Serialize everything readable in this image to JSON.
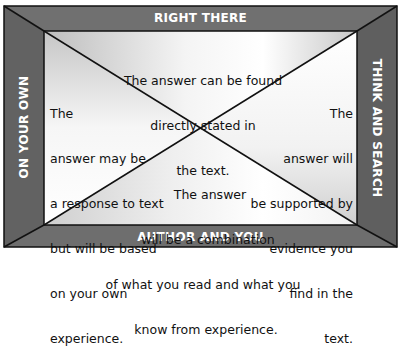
{
  "colors": {
    "frame": "#6b6b6b",
    "frame_dark": "#5a5a5a",
    "border_line": "#111111",
    "label_text": "#ffffff",
    "body_text": "#111111"
  },
  "bands": {
    "top": "RIGHT THERE",
    "bottom": "AUTHOR AND YOU",
    "left": "ON YOUR OWN",
    "right": "THINK AND SEARCH"
  },
  "quadrants": {
    "top": {
      "lines": [
        "The answer can be found",
        "directly stated in",
        "the text."
      ]
    },
    "left": {
      "lines": [
        "The",
        "answer may be",
        "a response to text",
        "but will be based",
        "on your own",
        "experience."
      ]
    },
    "right": {
      "lines": [
        "The",
        "answer will",
        "be supported by",
        "evidence you",
        "find in the",
        "text."
      ]
    },
    "bottom": {
      "lines": [
        "The answer",
        "will be a combination",
        "of what you read and what you",
        "know from experience."
      ]
    }
  }
}
